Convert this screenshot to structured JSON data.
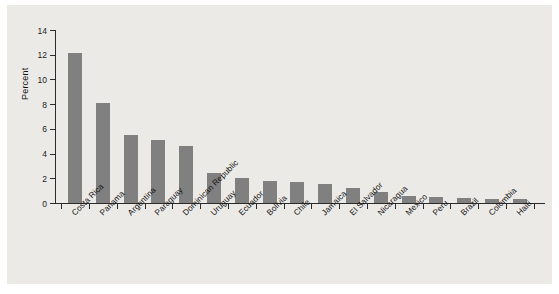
{
  "chart_data": {
    "type": "bar",
    "title": "",
    "xlabel": "",
    "ylabel": "Percent",
    "ylim": [
      0,
      14
    ],
    "yticks": [
      0,
      2,
      4,
      6,
      8,
      10,
      12,
      14
    ],
    "grid": false,
    "legend": null,
    "bar_color": "#808080",
    "background_color": "#eceae7",
    "axis_color": "#2b2b2b",
    "categories": [
      "Costa Rica",
      "Panama",
      "Argentina",
      "Paraguay",
      "Dominican Republic",
      "Uruguay",
      "Ecuador",
      "Bolivia",
      "Chile",
      "Jamaica",
      "El Salvador",
      "Nicaragua",
      "Mexico",
      "Peru",
      "Brazil",
      "Colombia",
      "Haiti"
    ],
    "values": [
      12.1,
      8.1,
      5.5,
      5.1,
      4.6,
      2.4,
      2.0,
      1.8,
      1.7,
      1.5,
      1.2,
      0.9,
      0.6,
      0.5,
      0.4,
      0.3,
      0.3
    ]
  }
}
